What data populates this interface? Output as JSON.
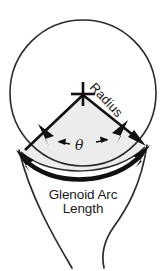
{
  "figure": {
    "caption_labels": {
      "radius": "Radius",
      "theta": "θ",
      "arc_line1": "Glenoid Arc",
      "arc_line2": "Length"
    },
    "colors": {
      "ink": "#1a1a1a",
      "outline": "#2b2b2b",
      "sector_fill": "#ececec",
      "background": "#ffffff"
    },
    "geometry": {
      "circle_center_x": 83,
      "circle_center_y": 93,
      "circle_radius": 73,
      "sector_apex_x": 83,
      "sector_apex_y": 93,
      "sector_left_x": 22,
      "sector_left_y": 152,
      "sector_right_x": 144,
      "sector_right_y": 147
    },
    "markers": {
      "center_cross": "plus-marker",
      "radius_arrow": "arrowhead",
      "angle_arrows": "double-arrow",
      "arc_arrows": "double-headed-arc-arrow"
    }
  }
}
